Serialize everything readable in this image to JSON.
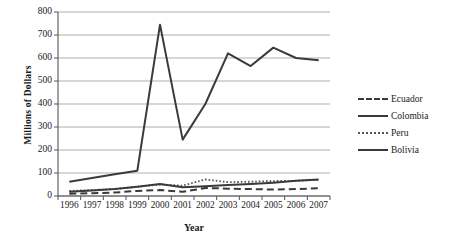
{
  "chart_data": {
    "type": "line",
    "title": "",
    "xlabel": "Year",
    "ylabel": "Millions of Dollars",
    "categories": [
      "1996",
      "1997",
      "1998",
      "1999",
      "2000",
      "2001",
      "2002",
      "2003",
      "2004",
      "2005",
      "2006",
      "2007"
    ],
    "ylim": [
      0,
      800
    ],
    "ytick_step": 100,
    "yticks": [
      "800",
      "700",
      "600",
      "500",
      "400",
      "300",
      "200",
      "100",
      "0"
    ],
    "grid": "horizontal",
    "legend_position": "right",
    "series": [
      {
        "name": "Ecuador",
        "style": "dashed",
        "color": "#3a3a3a",
        "values": [
          10,
          12,
          15,
          22,
          26,
          18,
          35,
          32,
          30,
          28,
          30,
          34
        ]
      },
      {
        "name": "Colombia",
        "style": "solid",
        "color": "#3a3a3a",
        "values": [
          62,
          78,
          95,
          110,
          745,
          245,
          400,
          620,
          565,
          645,
          600,
          590
        ]
      },
      {
        "name": "Peru",
        "style": "dotted",
        "color": "#555555",
        "values": [
          22,
          26,
          30,
          40,
          50,
          45,
          72,
          60,
          62,
          65,
          66,
          70
        ]
      },
      {
        "name": "Bolivia",
        "style": "solid",
        "color": "#3a3a3a",
        "values": [
          18,
          24,
          30,
          40,
          52,
          38,
          42,
          48,
          52,
          58,
          66,
          72
        ]
      }
    ]
  },
  "axes": {
    "y_title": "Millions of Dollars",
    "x_title": "Year"
  }
}
